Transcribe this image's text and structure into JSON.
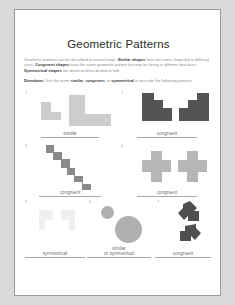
{
  "worksheet": {
    "title": "Geometric Patterns",
    "intro_runs": [
      {
        "text": "Geometric patterns can be described in several ways. ",
        "bold": false
      },
      {
        "text": "Similar shapes",
        "bold": true
      },
      {
        "text": " have the same shape but in differing sizes. ",
        "bold": false
      },
      {
        "text": "Congruent shapes",
        "bold": true
      },
      {
        "text": " have the same geometric pattern but may be facing in different directions. ",
        "bold": false
      },
      {
        "text": "Symmetrical shapes",
        "bold": true
      },
      {
        "text": " are identical when divided in half.",
        "bold": false
      }
    ],
    "directions_label": "Directions:",
    "directions_runs": [
      {
        "text": " Use the terms ",
        "bold": false
      },
      {
        "text": "similar",
        "bold": true
      },
      {
        "text": ", ",
        "bold": false
      },
      {
        "text": "congruent",
        "bold": true
      },
      {
        "text": ", or ",
        "bold": false
      },
      {
        "text": "symmetrical",
        "bold": true
      },
      {
        "text": " to describe the following patterns.",
        "bold": false
      }
    ],
    "problems": [
      {
        "number": "1.",
        "answer": "similar",
        "answer_line2": "",
        "shape_kind": "L-shapes",
        "color": "#c9c9c9"
      },
      {
        "number": "2.",
        "answer": "congruent",
        "answer_line2": "",
        "shape_kind": "mirrored-staircases",
        "color": "#5a5a5a"
      },
      {
        "number": "3.",
        "answer": "congruent",
        "answer_line2": "",
        "shape_kind": "diagonal-zigzags",
        "color": "#8a8a8a"
      },
      {
        "number": "4.",
        "answer": "congruent",
        "answer_line2": "",
        "shape_kind": "plus-crosses",
        "color": "#b4b4b4"
      },
      {
        "number": "5.",
        "answer": "symmetrical",
        "answer_line2": "",
        "shape_kind": "faint-pair",
        "color": "#e6e6e6"
      },
      {
        "number": "6.",
        "answer": "similar",
        "answer_line2": "or symmetrical",
        "shape_kind": "two-circles",
        "color": "#b0b0b0"
      },
      {
        "number": "7.",
        "answer": "congruent",
        "answer_line2": "",
        "shape_kind": "arrow-pair",
        "color": "#4f4f4f"
      }
    ]
  }
}
